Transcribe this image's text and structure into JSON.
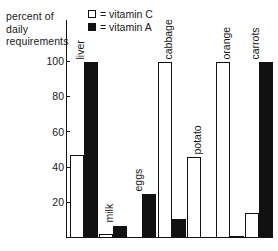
{
  "axis_title": {
    "lines": [
      "percent of",
      "daily",
      "requirements"
    ]
  },
  "legend": {
    "items": [
      {
        "swatch": "open-square",
        "label": "= vitamin C",
        "color": "#ffffff"
      },
      {
        "swatch": "filled-square",
        "label": "= vitamin A",
        "color": "#111111"
      }
    ]
  },
  "chart_data": {
    "type": "bar",
    "title": "",
    "subtitle": "",
    "xlabel": "",
    "ylabel": "percent of daily requirements",
    "ylim": [
      0,
      105
    ],
    "yticks": [
      100,
      80,
      60,
      40,
      20
    ],
    "grid": false,
    "legend_position": "top",
    "categories": [
      "liver",
      "milk",
      "eggs",
      "cabbage",
      "potato",
      "orange",
      "carrots"
    ],
    "series": [
      {
        "name": "vitamin C",
        "color": "#ffffff",
        "values": [
          47,
          2,
          0,
          100,
          46,
          100,
          14
        ]
      },
      {
        "name": "vitamin A",
        "color": "#111111",
        "values": [
          100,
          7,
          25,
          11,
          0,
          1,
          100
        ]
      }
    ]
  }
}
